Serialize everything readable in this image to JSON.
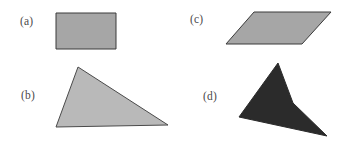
{
  "figure": {
    "background_color": "#ffffff",
    "width": 343,
    "height": 145
  },
  "shapes": [
    {
      "key": "a",
      "label": "(a)",
      "name": "rectangle",
      "fill": "#a6a6a6",
      "stroke": "#3b3b3b",
      "stroke_width": 1,
      "points": "56,13 116,13 116,49 56,49"
    },
    {
      "key": "b",
      "label": "(b)",
      "name": "triangle",
      "fill": "#b9b9b9",
      "stroke": "#4a4a4a",
      "stroke_width": 1,
      "points": "78,67 168,125 56,127"
    },
    {
      "key": "c",
      "label": "(c)",
      "name": "parallelogram",
      "fill": "#a6a6a6",
      "stroke": "#3b3b3b",
      "stroke_width": 1,
      "points": "254,12 331,12 302,44 226,44"
    },
    {
      "key": "d",
      "label": "(d)",
      "name": "concave-dart",
      "fill": "#2b2b2b",
      "stroke": "#2b2b2b",
      "stroke_width": 1,
      "points": "278,63 293,103 327,136 239,117"
    }
  ]
}
